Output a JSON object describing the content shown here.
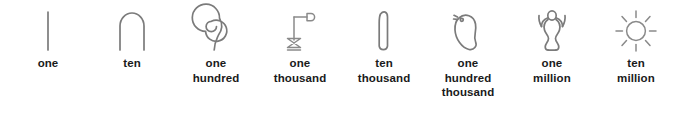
{
  "figure": {
    "background_color": "#ffffff",
    "stroke_color": "#7b7b7b",
    "caption_color": "#1a1a1a"
  },
  "numerals": [
    {
      "value": "1",
      "icon": "single-stroke-icon",
      "glyph_name": "single stroke",
      "label_lines": [
        "one"
      ],
      "label": "one"
    },
    {
      "value": "10",
      "icon": "heel-bone-arch-icon",
      "glyph_name": "heel bone (arch)",
      "label_lines": [
        "ten"
      ],
      "label": "ten"
    },
    {
      "value": "100",
      "icon": "coil-of-rope-icon",
      "glyph_name": "coil of rope",
      "label_lines": [
        "one",
        "hundred"
      ],
      "label": "one hundred"
    },
    {
      "value": "1000",
      "icon": "lotus-plant-icon",
      "glyph_name": "lotus plant",
      "label_lines": [
        "one",
        "thousand"
      ],
      "label": "one thousand"
    },
    {
      "value": "10000",
      "icon": "bent-finger-icon",
      "glyph_name": "bent finger",
      "label_lines": [
        "ten",
        "thousand"
      ],
      "label": "ten thousand"
    },
    {
      "value": "100000",
      "icon": "tadpole-icon",
      "glyph_name": "tadpole",
      "label_lines": [
        "one",
        "hundred",
        "thousand"
      ],
      "label": "one hundred thousand"
    },
    {
      "value": "1000000",
      "icon": "heh-god-figure-icon",
      "glyph_name": "god Heh with raised arms",
      "label_lines": [
        "one",
        "million"
      ],
      "label": "one million"
    },
    {
      "value": "10000000",
      "icon": "sun-disk-rays-icon",
      "glyph_name": "sun disk with rays",
      "label_lines": [
        "ten",
        "million"
      ],
      "label": "ten million"
    }
  ]
}
